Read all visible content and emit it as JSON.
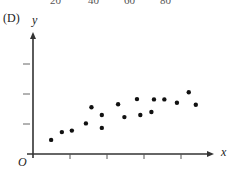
{
  "option_label": "(D)",
  "top_cutoff_labels": [
    "20",
    "40",
    "60",
    "80"
  ],
  "chart_data": {
    "type": "scatter",
    "title": "",
    "xlabel": "x",
    "ylabel": "y",
    "origin_label": "O",
    "grid": false,
    "legend": null,
    "x_ticks": 4,
    "y_ticks": 3,
    "tick_labels_shown": false,
    "xlim": [
      0,
      5
    ],
    "ylim": [
      0,
      4
    ],
    "points": [
      {
        "x": 0.49,
        "y": 0.47
      },
      {
        "x": 0.78,
        "y": 0.73
      },
      {
        "x": 1.05,
        "y": 0.78
      },
      {
        "x": 1.43,
        "y": 1.02
      },
      {
        "x": 1.58,
        "y": 1.56
      },
      {
        "x": 1.86,
        "y": 1.3
      },
      {
        "x": 1.86,
        "y": 0.87
      },
      {
        "x": 2.3,
        "y": 1.66
      },
      {
        "x": 2.47,
        "y": 1.23
      },
      {
        "x": 2.81,
        "y": 1.83
      },
      {
        "x": 2.9,
        "y": 1.3
      },
      {
        "x": 3.2,
        "y": 1.4
      },
      {
        "x": 3.27,
        "y": 1.82
      },
      {
        "x": 3.55,
        "y": 1.82
      },
      {
        "x": 3.89,
        "y": 1.71
      },
      {
        "x": 4.21,
        "y": 2.06
      },
      {
        "x": 4.4,
        "y": 1.64
      }
    ]
  },
  "layout": {
    "origin_px": [
      33,
      154
    ],
    "x_unit_px": 37,
    "y_unit_px": 30,
    "x_axis_end_px": 214,
    "y_axis_top_px": 32,
    "axis_color": "#333333",
    "point_color": "#111111"
  }
}
